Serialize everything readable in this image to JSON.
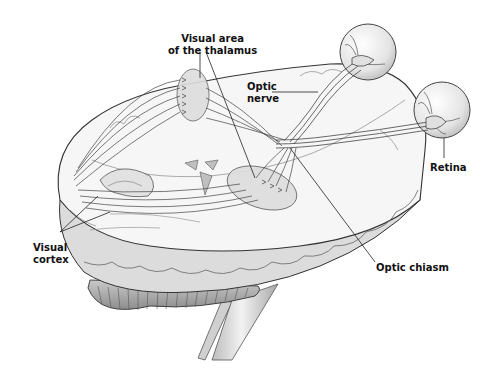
{
  "figure": {
    "labels": {
      "thalamus": {
        "line1": "Visual area",
        "line2": "of the thalamus"
      },
      "optic_nerve": {
        "line1": "Optic",
        "line2": "nerve"
      },
      "retina": {
        "text": "Retina"
      },
      "visual_cortex": {
        "line1": "Visual",
        "line2": "cortex"
      },
      "optic_chiasm": {
        "text": "Optic chiasm"
      }
    },
    "colors": {
      "outline": "#3a3a3a",
      "brain_fill": "#f4f4f4",
      "shadow": "#c8c8c8",
      "nucleus_fill": "#d8d8d8",
      "label": "#111111"
    }
  }
}
